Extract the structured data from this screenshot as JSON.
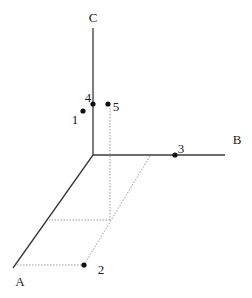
{
  "diagram": {
    "type": "3d-axes-points",
    "axes": [
      {
        "label": "A",
        "from": [
          93,
          155
        ],
        "to": [
          13,
          268
        ],
        "label_pos": [
          20,
          286
        ]
      },
      {
        "label": "B",
        "from": [
          93,
          155
        ],
        "to": [
          225,
          155
        ],
        "label_pos": [
          237,
          144
        ]
      },
      {
        "label": "C",
        "from": [
          93,
          155
        ],
        "to": [
          93,
          28
        ],
        "label_pos": [
          93,
          22
        ]
      }
    ],
    "points": [
      {
        "label": "1",
        "x": 83,
        "y": 111,
        "label_pos": [
          75,
          124
        ]
      },
      {
        "label": "2",
        "x": 84,
        "y": 265,
        "label_pos": [
          101,
          274
        ]
      },
      {
        "label": "3",
        "x": 175,
        "y": 155,
        "label_pos": [
          180,
          152
        ]
      },
      {
        "label": "4",
        "x": 93,
        "y": 104,
        "label_pos": [
          86,
          102
        ]
      },
      {
        "label": "5",
        "x": 108,
        "y": 104,
        "label_pos": [
          114,
          112
        ]
      }
    ],
    "colors": {
      "axis": "#3a3a3a",
      "dotted": "#999999",
      "point": "#111111",
      "text": "#222222"
    }
  }
}
